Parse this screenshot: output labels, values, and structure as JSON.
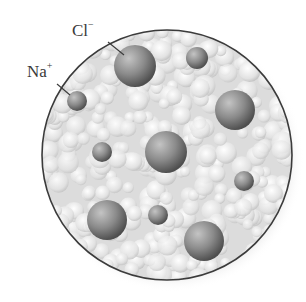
{
  "diagram": {
    "labels": [
      {
        "id": "chloride",
        "symbol": "Cl",
        "charge": "−",
        "x": 72,
        "y": 22,
        "leader": [
          108,
          42,
          124,
          55
        ]
      },
      {
        "id": "sodium",
        "symbol": "Na",
        "charge": "+",
        "x": 27,
        "y": 63,
        "leader": [
          57,
          84,
          70,
          95
        ]
      }
    ],
    "container": {
      "cx": 167,
      "cy": 155,
      "r": 125,
      "stroke": "#3b3b3b",
      "fill": "#e4e4e4"
    },
    "background_particles": "water molecules (light gray clusters)",
    "ions": [
      {
        "type": "Cl-",
        "cx": 135,
        "cy": 66,
        "r": 21
      },
      {
        "type": "Na+",
        "cx": 197,
        "cy": 58,
        "r": 11
      },
      {
        "type": "Na+",
        "cx": 77,
        "cy": 101,
        "r": 10
      },
      {
        "type": "Cl-",
        "cx": 235,
        "cy": 110,
        "r": 20
      },
      {
        "type": "Na+",
        "cx": 102,
        "cy": 152,
        "r": 10
      },
      {
        "type": "Cl-",
        "cx": 166,
        "cy": 152,
        "r": 21
      },
      {
        "type": "Na+",
        "cx": 244,
        "cy": 181,
        "r": 10
      },
      {
        "type": "Cl-",
        "cx": 107,
        "cy": 220,
        "r": 20
      },
      {
        "type": "Na+",
        "cx": 158,
        "cy": 215,
        "r": 10
      },
      {
        "type": "Cl-",
        "cx": 204,
        "cy": 241,
        "r": 20
      }
    ],
    "colors": {
      "ion_light": "#b8b8b8",
      "ion_dark": "#555555",
      "water_light": "#fafafa",
      "water_mid": "#cfcfcf",
      "text": "#3a3a3a"
    }
  }
}
